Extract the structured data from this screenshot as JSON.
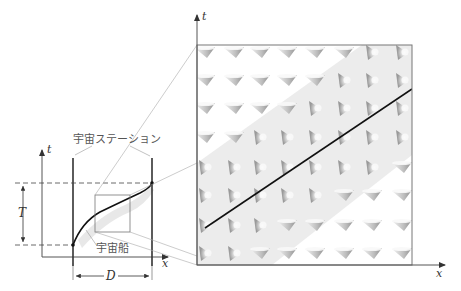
{
  "left_diagram": {
    "t_axis_label": "t",
    "x_axis_label": "x",
    "station_label": "宇宙ステーション",
    "spaceship_label": "宇宙船",
    "period_label": "T",
    "distance_label": "D"
  },
  "zoom_panel": {
    "t_axis_label": "t",
    "x_axis_label": "x",
    "grid": {
      "columns": 8,
      "rows": 8
    },
    "cone_orientation_outside_band": "down",
    "cone_orientation_inside_band": "right"
  },
  "colors": {
    "line": "#1a1a1a",
    "axis": "#555555",
    "band": "#ececec",
    "frame": "#777777",
    "guide": "#aaaaaa"
  }
}
